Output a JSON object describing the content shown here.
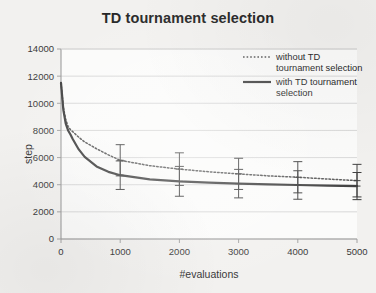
{
  "chart_data": {
    "type": "line",
    "title": "TD tournament selection",
    "xlabel": "#evaluations",
    "ylabel": "step",
    "xlim": [
      0,
      5000
    ],
    "ylim": [
      0,
      14000
    ],
    "xticks": [
      "0",
      "1000",
      "2000",
      "3000",
      "4000",
      "5000"
    ],
    "yticks": [
      "0",
      "2000",
      "4000",
      "6000",
      "8000",
      "10000",
      "12000",
      "14000"
    ],
    "grid": "horizontal",
    "legend_position": "top-right",
    "series": [
      {
        "name": "without TD tournament selection",
        "style": "dotted",
        "color": "#555555",
        "x": [
          0,
          40,
          80,
          120,
          160,
          200,
          300,
          400,
          600,
          800,
          1000,
          1500,
          2000,
          2500,
          3000,
          3500,
          4000,
          4500,
          5000
        ],
        "values": [
          11500,
          9700,
          8800,
          8300,
          8050,
          7900,
          7500,
          7150,
          6650,
          6200,
          5800,
          5400,
          5150,
          4950,
          4800,
          4650,
          4550,
          4420,
          4300
        ],
        "error_x": [
          1000,
          2000,
          3000,
          4000,
          5000
        ],
        "error_values": [
          5800,
          5150,
          4800,
          4550,
          4300
        ],
        "error_bars": [
          1150,
          1200,
          1150,
          1150,
          1200
        ]
      },
      {
        "name": "with TD tournament selection",
        "style": "solid",
        "color": "#3d3d3d",
        "x": [
          0,
          40,
          80,
          120,
          160,
          200,
          300,
          400,
          600,
          800,
          1000,
          1500,
          2000,
          2500,
          3000,
          3500,
          4000,
          4500,
          5000
        ],
        "values": [
          11500,
          9500,
          8500,
          8000,
          7700,
          7350,
          6600,
          6050,
          5350,
          4950,
          4700,
          4400,
          4250,
          4150,
          4080,
          4020,
          3980,
          3940,
          3900
        ],
        "error_x": [
          1000,
          2000,
          3000,
          4000,
          5000
        ],
        "error_values": [
          4700,
          4250,
          4080,
          3980,
          3900
        ],
        "error_bars": [
          1050,
          1100,
          1050,
          1050,
          1000
        ]
      }
    ]
  },
  "legend": {
    "items": [
      {
        "label_line1": "without TD",
        "label_line2": "tournament selection",
        "style": "dotted"
      },
      {
        "label_line1": "with TD tournament",
        "label_line2": "selection",
        "style": "solid"
      }
    ]
  },
  "colors": {
    "background": "#f2f1ef",
    "plot_border": "#9a9a9a",
    "gridline": "#d4d4d4",
    "series_solid": "#3d3d3d",
    "series_dotted": "#555555",
    "error_bar": "#3b3b3b"
  }
}
